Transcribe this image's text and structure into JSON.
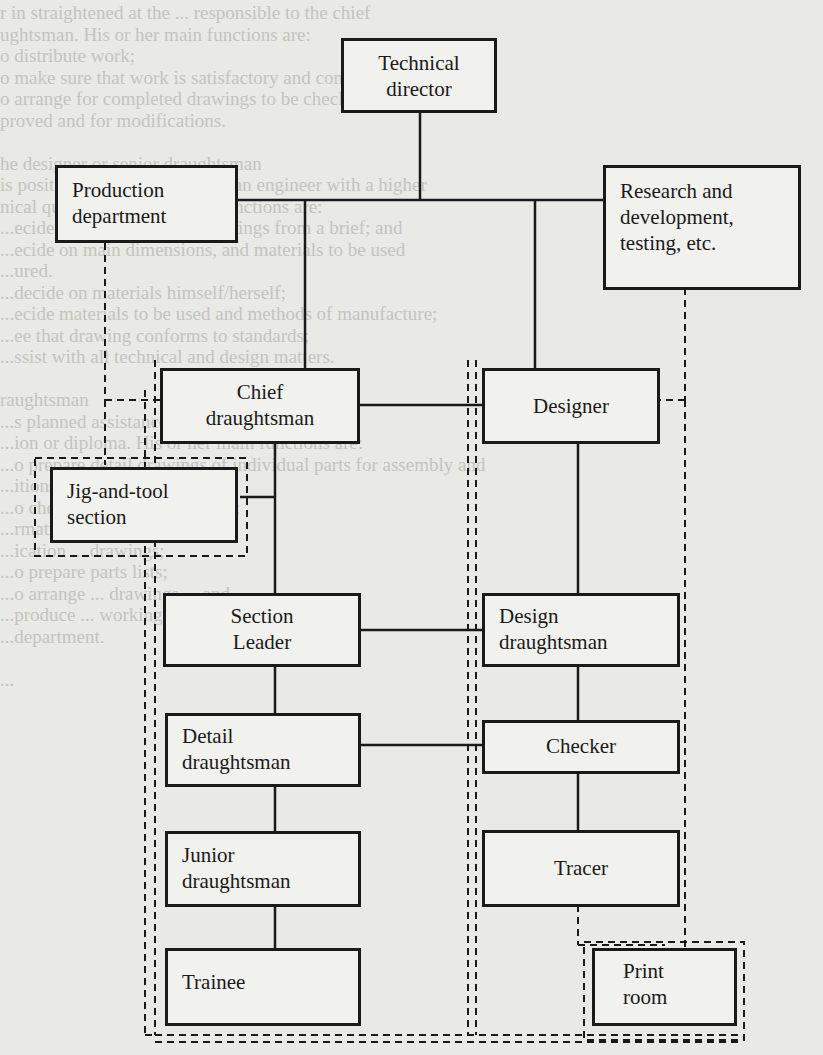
{
  "background_text": [
    "r in straightened at the ... responsible to the chief",
    "ughtsman. His or her main functions are:",
    "o distribute work;",
    "o make sure that work is satisfactory and completed on time;",
    "o arrange for completed drawings to be checked and",
    "proved and for modifications.",
    "",
    "he designer or senior draughtsman",
    "is position is usually a technician engineer with a higher",
    "nical qualification; the main functions are:",
    "...ecide the general layout drawings from a brief; and",
    "...ecide on main dimensions, and materials to be used",
    "...ured.",
    "...decide on materials himself/herself;",
    "...ecide materials to be used and methods of manufacture;",
    "...ee that drawing conforms to standards;",
    "...ssist with all technical and design matters.",
    "",
    "raughtsman",
    "...s planned assistance with an engineering",
    "...ion or diploma. His or her main functions are:",
    "...o prepare detail drawings of individual parts for assembly and",
    "...itions;",
    "...o check all ... design features;",
    "...rmation ... surface finishes ... ",
    "...ication ... drawings;",
    "...o prepare parts lists;",
    "...o arrange ... drawings ... and",
    "...produce ... working drawings ... the drawing",
    "...department.",
    "",
    "..."
  ],
  "org_chart": {
    "title": "Drawing office organisation",
    "nodes": [
      {
        "id": "technical_director",
        "label": [
          "Technical",
          "director"
        ]
      },
      {
        "id": "production_department",
        "label": [
          "Production",
          "department"
        ]
      },
      {
        "id": "research_development",
        "label": [
          "Research and",
          "development,",
          "testing, etc."
        ]
      },
      {
        "id": "chief_draughtsman",
        "label": [
          "Chief",
          "draughtsman"
        ]
      },
      {
        "id": "designer",
        "label": [
          "Designer"
        ]
      },
      {
        "id": "jig_tool_section",
        "label": [
          "Jig-and-tool",
          "section"
        ]
      },
      {
        "id": "section_leader",
        "label": [
          "Section",
          "Leader"
        ]
      },
      {
        "id": "design_draughtsman",
        "label": [
          "Design",
          "draughtsman"
        ]
      },
      {
        "id": "detail_draughtsman",
        "label": [
          "Detail",
          "draughtsman"
        ]
      },
      {
        "id": "checker",
        "label": [
          "Checker"
        ]
      },
      {
        "id": "junior_draughtsman",
        "label": [
          "Junior",
          "draughtsman"
        ]
      },
      {
        "id": "tracer",
        "label": [
          "Tracer"
        ]
      },
      {
        "id": "trainee",
        "label": [
          "Trainee"
        ]
      },
      {
        "id": "print_room",
        "label": [
          "Print",
          "room"
        ]
      }
    ],
    "edges": [
      {
        "from": "technical_director",
        "to": "production_department",
        "style": "solid"
      },
      {
        "from": "technical_director",
        "to": "research_development",
        "style": "solid"
      },
      {
        "from": "technical_director",
        "to": "chief_draughtsman",
        "style": "solid"
      },
      {
        "from": "technical_director",
        "to": "designer",
        "style": "solid"
      },
      {
        "from": "production_department",
        "to": "chief_draughtsman",
        "style": "dashed"
      },
      {
        "from": "research_development",
        "to": "designer",
        "style": "dashed"
      },
      {
        "from": "chief_draughtsman",
        "to": "designer",
        "style": "solid"
      },
      {
        "from": "chief_draughtsman",
        "to": "jig_tool_section",
        "style": "solid"
      },
      {
        "from": "chief_draughtsman",
        "to": "section_leader",
        "style": "solid"
      },
      {
        "from": "designer",
        "to": "design_draughtsman",
        "style": "solid"
      },
      {
        "from": "section_leader",
        "to": "design_draughtsman",
        "style": "solid"
      },
      {
        "from": "section_leader",
        "to": "detail_draughtsman",
        "style": "solid"
      },
      {
        "from": "design_draughtsman",
        "to": "checker",
        "style": "solid"
      },
      {
        "from": "detail_draughtsman",
        "to": "checker",
        "style": "solid"
      },
      {
        "from": "detail_draughtsman",
        "to": "junior_draughtsman",
        "style": "solid"
      },
      {
        "from": "checker",
        "to": "tracer",
        "style": "solid"
      },
      {
        "from": "junior_draughtsman",
        "to": "trainee",
        "style": "solid"
      },
      {
        "from": "tracer",
        "to": "print_room",
        "style": "dashed"
      }
    ]
  }
}
